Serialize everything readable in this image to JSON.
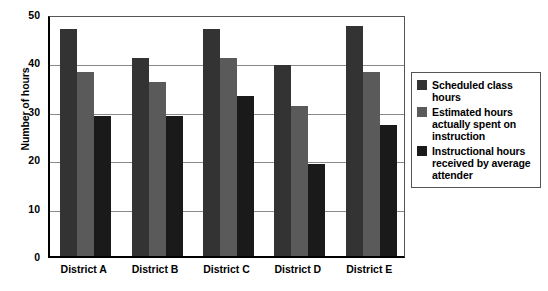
{
  "chart_data": {
    "type": "bar",
    "title": "",
    "subtitle": "",
    "xlabel": "",
    "ylabel": "Number of hours",
    "categories": [
      "District A",
      "District B",
      "District C",
      "District D",
      "District E"
    ],
    "series": [
      {
        "name": "Scheduled class hours",
        "color": "#333333",
        "values": [
          47,
          41,
          47,
          39.5,
          47.5
        ]
      },
      {
        "name": "Estimated hours actually spent on instruction",
        "color": "#5a5a5a",
        "values": [
          38,
          36,
          41,
          31,
          38
        ]
      },
      {
        "name": "Instructional hours received by average attender",
        "color": "#1a1a1a",
        "values": [
          29,
          29,
          33,
          19,
          27
        ]
      }
    ],
    "ylim": [
      0,
      50
    ],
    "yticks": [
      0,
      10,
      20,
      30,
      40,
      50
    ],
    "ytick_labels": [
      "0",
      "10",
      "20",
      "30",
      "40",
      "50"
    ],
    "grid": true,
    "grid_axis": "y",
    "legend_position": "right",
    "plot_background": "#ffffff"
  },
  "legend": {
    "entries": [
      {
        "label": "Scheduled class hours"
      },
      {
        "label": "Estimated hours actually spent on instruction"
      },
      {
        "label": "Instructional hours received by average attender"
      }
    ]
  }
}
